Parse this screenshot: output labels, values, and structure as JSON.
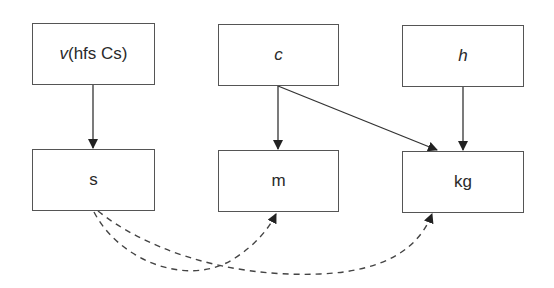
{
  "diagram": {
    "title": "",
    "nodes": [
      {
        "id": "v",
        "label_italic": "v",
        "label_rest": "(hfs Cs)",
        "x": 32,
        "y": 23,
        "w": 123,
        "h": 62
      },
      {
        "id": "c",
        "label_italic": "c",
        "label_rest": "",
        "x": 218,
        "y": 24,
        "w": 121,
        "h": 62
      },
      {
        "id": "h",
        "label_italic": "h",
        "label_rest": "",
        "x": 402,
        "y": 25,
        "w": 122,
        "h": 62
      },
      {
        "id": "s",
        "label": "s",
        "x": 32,
        "y": 149,
        "w": 123,
        "h": 62
      },
      {
        "id": "m",
        "label": "m",
        "x": 218,
        "y": 150,
        "w": 121,
        "h": 62
      },
      {
        "id": "kg",
        "label": "kg",
        "x": 402,
        "y": 151,
        "w": 122,
        "h": 62
      }
    ],
    "edges": [
      {
        "from": "v",
        "to": "s",
        "style": "solid"
      },
      {
        "from": "c",
        "to": "m",
        "style": "solid"
      },
      {
        "from": "c",
        "to": "kg",
        "style": "solid"
      },
      {
        "from": "h",
        "to": "kg",
        "style": "solid"
      },
      {
        "from": "s",
        "to": "m",
        "style": "dashed"
      },
      {
        "from": "s",
        "to": "kg",
        "style": "dashed"
      }
    ],
    "colors": {
      "line": "#333333",
      "border": "#555555",
      "text": "#2a2a2a",
      "background": "#ffffff"
    }
  }
}
